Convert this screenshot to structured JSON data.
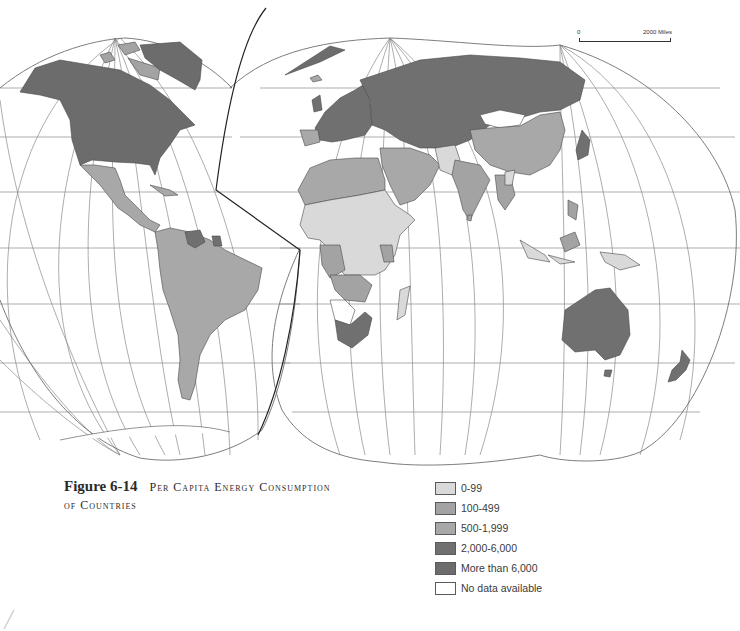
{
  "figure": {
    "number": "Figure 6-14",
    "title_line1": "Per Capita Energy Consumption",
    "title_line2": "of Countries"
  },
  "scale_bar": {
    "start": "0",
    "end": "2000 Miles"
  },
  "legend": {
    "items": [
      {
        "label": "0-99",
        "color": "#d9d9d9"
      },
      {
        "label": "100-499",
        "color": "#a3a3a3"
      },
      {
        "label": "500-1,999",
        "color": "#a8a8a8"
      },
      {
        "label": "2,000-6,000",
        "color": "#707070"
      },
      {
        "label": "More than 6,000",
        "color": "#6c6c6c"
      },
      {
        "label": "No data available",
        "color": "#ffffff"
      }
    ]
  },
  "map": {
    "projection": "interrupted (Goode-style) world map",
    "regions": [
      {
        "name": "North America (USA, Canada)",
        "class": "More than 6,000"
      },
      {
        "name": "Greenland",
        "class": "More than 6,000"
      },
      {
        "name": "Mexico & Central America",
        "class": "500-1,999"
      },
      {
        "name": "Venezuela",
        "class": "2,000-6,000"
      },
      {
        "name": "South America",
        "class": "500-1,999"
      },
      {
        "name": "Western & Northern Europe",
        "class": "2,000-6,000"
      },
      {
        "name": "USSR",
        "class": "2,000-6,000"
      },
      {
        "name": "North Africa & Middle East",
        "class": "500-1,999"
      },
      {
        "name": "Sub-Saharan Africa",
        "class": "0-99"
      },
      {
        "name": "Southern Africa (South Africa)",
        "class": "2,000-6,000"
      },
      {
        "name": "Namibia / Botswana",
        "class": "No data available"
      },
      {
        "name": "Mongolia",
        "class": "No data available"
      },
      {
        "name": "China",
        "class": "500-1,999"
      },
      {
        "name": "India",
        "class": "100-499"
      },
      {
        "name": "Afghanistan / Pakistan",
        "class": "0-99"
      },
      {
        "name": "Japan",
        "class": "2,000-6,000"
      },
      {
        "name": "Southeast Asia & Indonesia",
        "class": "100-499"
      },
      {
        "name": "Papua New Guinea",
        "class": "0-99"
      },
      {
        "name": "Madagascar",
        "class": "0-99"
      },
      {
        "name": "Australia",
        "class": "2,000-6,000"
      },
      {
        "name": "New Zealand",
        "class": "2,000-6,000"
      }
    ]
  }
}
